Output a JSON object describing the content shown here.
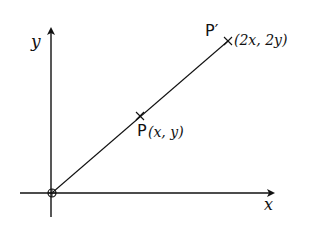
{
  "diagram": {
    "type": "coordinate-enlargement",
    "axes": {
      "x_label": "x",
      "y_label": "y"
    },
    "origin": {
      "marker": "circle-with-cross"
    },
    "points": [
      {
        "name": "P",
        "label": "P",
        "coords_label": "(x, y)"
      },
      {
        "name": "P_prime",
        "label": "P′",
        "coords_label": "(2x, 2y)"
      }
    ],
    "line": {
      "from": "origin",
      "through": "P",
      "to": "P_prime"
    },
    "colors": {
      "ink": "#111111",
      "background": "#ffffff"
    }
  }
}
